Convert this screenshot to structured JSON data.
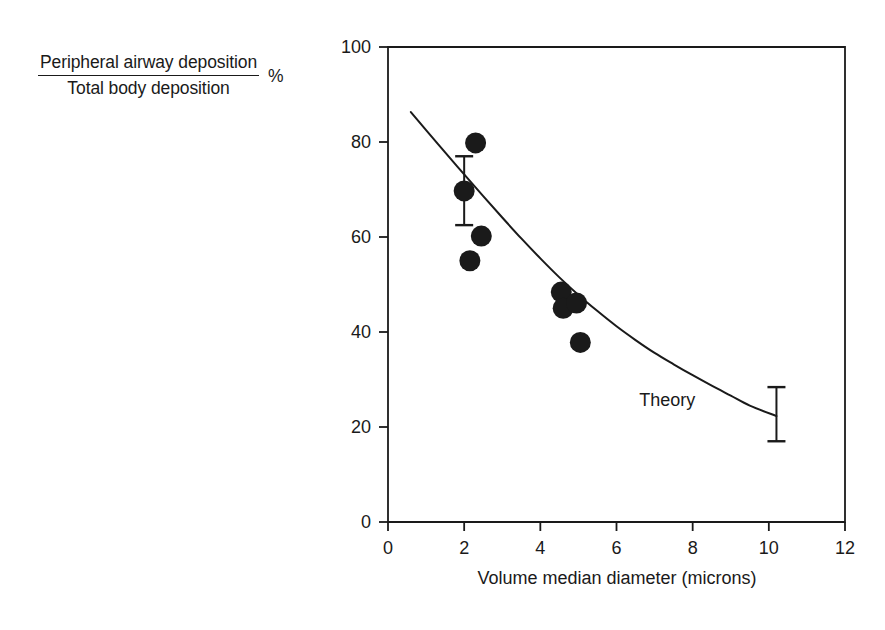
{
  "chart_data": {
    "type": "scatter",
    "title": "",
    "subtitle": "",
    "ylabel_numerator": "Peripheral airway deposition",
    "ylabel_denominator": "Total body deposition",
    "ylabel_units": "%",
    "xlabel": "Volume median diameter  (microns)",
    "xlim": [
      0,
      12
    ],
    "ylim": [
      0,
      100
    ],
    "xticks": [
      0,
      2,
      4,
      6,
      8,
      10,
      12
    ],
    "yticks": [
      0,
      20,
      40,
      60,
      80,
      100
    ],
    "xtick_labels": [
      "0",
      "2",
      "4",
      "6",
      "8",
      "10",
      "12"
    ],
    "ytick_labels": [
      "0",
      "20",
      "40",
      "60",
      "80",
      "100"
    ],
    "grid": false,
    "legend": "none",
    "frame": "box",
    "marker": "filled-circle",
    "marker_color": "#1a1a1a",
    "line_color": "#1a1a1a",
    "series": [
      {
        "name": "Measured data",
        "type": "scatter",
        "points": [
          {
            "x": 2.3,
            "y": 79.8
          },
          {
            "x": 2.0,
            "y": 69.7
          },
          {
            "x": 2.45,
            "y": 60.2
          },
          {
            "x": 2.15,
            "y": 55.0
          },
          {
            "x": 4.55,
            "y": 48.4
          },
          {
            "x": 4.6,
            "y": 45.0
          },
          {
            "x": 4.95,
            "y": 46.1
          },
          {
            "x": 5.05,
            "y": 37.8
          }
        ]
      },
      {
        "name": "Theory",
        "type": "line",
        "label": "Theory",
        "points": [
          {
            "x": 0.6,
            "y": 86.3
          },
          {
            "x": 1.0,
            "y": 82.5
          },
          {
            "x": 1.5,
            "y": 77.8
          },
          {
            "x": 2.0,
            "y": 73.2
          },
          {
            "x": 2.5,
            "y": 68.6
          },
          {
            "x": 3.0,
            "y": 64.1
          },
          {
            "x": 3.5,
            "y": 59.7
          },
          {
            "x": 4.0,
            "y": 55.5
          },
          {
            "x": 4.5,
            "y": 51.5
          },
          {
            "x": 5.0,
            "y": 47.8
          },
          {
            "x": 5.5,
            "y": 44.4
          },
          {
            "x": 6.0,
            "y": 41.2
          },
          {
            "x": 6.5,
            "y": 38.3
          },
          {
            "x": 7.0,
            "y": 35.6
          },
          {
            "x": 7.5,
            "y": 33.2
          },
          {
            "x": 8.0,
            "y": 30.9
          },
          {
            "x": 8.5,
            "y": 28.7
          },
          {
            "x": 9.0,
            "y": 26.6
          },
          {
            "x": 9.5,
            "y": 24.5
          },
          {
            "x": 10.2,
            "y": 22.3
          }
        ]
      }
    ],
    "error_bars": [
      {
        "x": 2.0,
        "y": 69.7,
        "upper": 77.0,
        "lower": 62.5,
        "attached_to": "data-point"
      },
      {
        "x": 10.2,
        "y": 22.3,
        "upper": 28.4,
        "lower": 17.0,
        "attached_to": "theory-curve-end"
      }
    ],
    "annotations": [
      {
        "text": "Theory",
        "x": 6.6,
        "y": 25.5
      }
    ]
  }
}
